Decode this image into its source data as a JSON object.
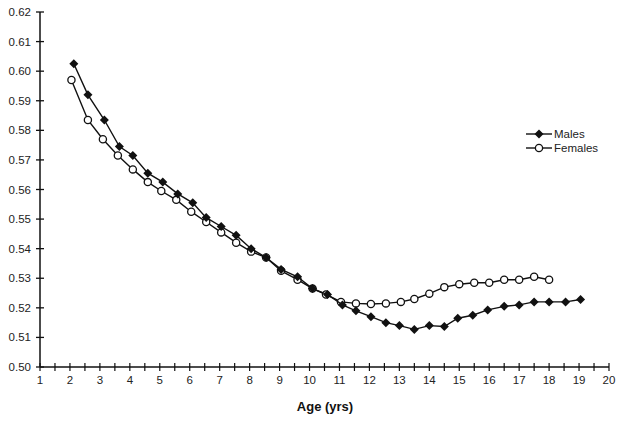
{
  "chart_data": {
    "type": "line",
    "title": "",
    "xlabel": "Age (yrs)",
    "ylabel": "",
    "xlim": [
      1,
      20
    ],
    "ylim": [
      0.5,
      0.62
    ],
    "grid": false,
    "legend_position": "right-middle",
    "x_ticks": [
      1,
      2,
      3,
      4,
      5,
      6,
      7,
      8,
      9,
      10,
      11,
      12,
      13,
      14,
      15,
      16,
      17,
      18,
      19,
      20
    ],
    "x_minor_step": 0.5,
    "y_ticks": [
      "0.50",
      "0.51",
      "0.52",
      "0.53",
      "0.54",
      "0.55",
      "0.56",
      "0.57",
      "0.58",
      "0.59",
      "0.60",
      "0.61",
      "0.62"
    ],
    "series": [
      {
        "name": "Males",
        "marker": "filled-diamond",
        "color": "#111111",
        "x": [
          2.13,
          2.6,
          3.15,
          3.65,
          4.1,
          4.6,
          5.1,
          5.6,
          6.1,
          6.55,
          7.05,
          7.55,
          8.05,
          8.55,
          9.05,
          9.6,
          10.1,
          10.6,
          11.1,
          11.55,
          12.05,
          12.55,
          13.0,
          13.5,
          14.0,
          14.5,
          14.95,
          15.45,
          15.95,
          16.5,
          17.0,
          17.5,
          18.0,
          18.55,
          19.05
        ],
        "values": [
          0.6025,
          0.592,
          0.5835,
          0.5745,
          0.5715,
          0.5655,
          0.5625,
          0.5585,
          0.5555,
          0.5505,
          0.5475,
          0.5445,
          0.54,
          0.537,
          0.533,
          0.5305,
          0.5265,
          0.5245,
          0.521,
          0.519,
          0.517,
          0.515,
          0.514,
          0.5127,
          0.514,
          0.5137,
          0.5165,
          0.5175,
          0.5193,
          0.5205,
          0.521,
          0.522,
          0.522,
          0.522,
          0.5228
        ]
      },
      {
        "name": "Females",
        "marker": "open-circle",
        "color": "#111111",
        "x": [
          2.05,
          2.6,
          3.1,
          3.6,
          4.1,
          4.6,
          5.05,
          5.55,
          6.05,
          6.55,
          7.05,
          7.55,
          8.05,
          8.55,
          9.05,
          9.6,
          10.1,
          10.55,
          11.05,
          11.55,
          12.05,
          12.55,
          13.05,
          13.5,
          14.0,
          14.5,
          15.0,
          15.5,
          16.0,
          16.5,
          17.0,
          17.5,
          18.0
        ],
        "values": [
          0.597,
          0.5835,
          0.577,
          0.5715,
          0.5668,
          0.5625,
          0.5595,
          0.5565,
          0.5525,
          0.549,
          0.5455,
          0.542,
          0.539,
          0.537,
          0.5325,
          0.5295,
          0.5265,
          0.5245,
          0.522,
          0.5215,
          0.5213,
          0.5215,
          0.522,
          0.523,
          0.5248,
          0.527,
          0.528,
          0.5285,
          0.5285,
          0.5295,
          0.5295,
          0.5305,
          0.5295
        ]
      }
    ]
  },
  "legend": {
    "items": [
      {
        "label": "Males"
      },
      {
        "label": "Females"
      }
    ]
  },
  "axes": {
    "x_title": "Age (yrs)"
  }
}
